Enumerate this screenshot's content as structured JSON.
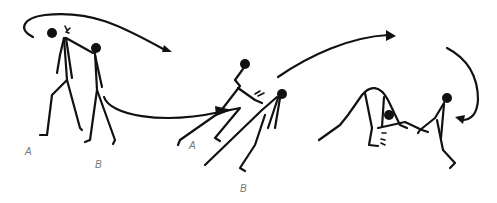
{
  "figure": {
    "panels": [
      {
        "id": "panel-1",
        "labels": {
          "a": "A",
          "b": "B"
        }
      },
      {
        "id": "panel-2",
        "labels": {
          "a": "A",
          "b": "B"
        }
      },
      {
        "id": "panel-3"
      }
    ],
    "colors": {
      "ink": "#111111",
      "label": "#777777",
      "background": "#ffffff"
    }
  }
}
